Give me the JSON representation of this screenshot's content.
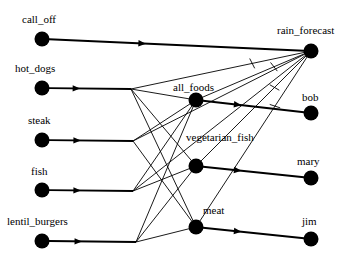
{
  "diagram": {
    "type": "causal-influence-graph",
    "background_color": "#ffffff",
    "node_color": "#000000",
    "edge_color": "#000000",
    "node_radius": 7.5,
    "nodes": [
      {
        "id": "call_off",
        "label": "call_off",
        "x": 42,
        "y": 39,
        "label_x": 22,
        "label_y": 14,
        "column": "left"
      },
      {
        "id": "hot_dogs",
        "label": "hot_dogs",
        "x": 42,
        "y": 88,
        "label_x": 15,
        "label_y": 63,
        "column": "left"
      },
      {
        "id": "steak",
        "label": "steak",
        "x": 42,
        "y": 140,
        "label_x": 28,
        "label_y": 115,
        "column": "left"
      },
      {
        "id": "fish",
        "label": "fish",
        "x": 42,
        "y": 190,
        "label_x": 31,
        "label_y": 166,
        "column": "left"
      },
      {
        "id": "lentil_burgers",
        "label": "lentil_burgers",
        "x": 42,
        "y": 241,
        "label_x": 7,
        "label_y": 216,
        "column": "left"
      },
      {
        "id": "all_foods",
        "label": "all_foods",
        "x": 196,
        "y": 100,
        "label_x": 173,
        "label_y": 82,
        "column": "middle"
      },
      {
        "id": "vegetarian_fish",
        "label": "vegetarian_fish",
        "x": 196,
        "y": 166,
        "label_x": 186,
        "label_y": 132,
        "column": "middle"
      },
      {
        "id": "meat",
        "label": "meat",
        "x": 196,
        "y": 227,
        "label_x": 203,
        "label_y": 205,
        "column": "middle"
      },
      {
        "id": "rain_forecast",
        "label": "rain_forecast",
        "x": 311,
        "y": 51,
        "label_x": 277,
        "label_y": 25,
        "column": "right"
      },
      {
        "id": "bob",
        "label": "bob",
        "x": 311,
        "y": 113,
        "label_x": 302,
        "label_y": 92,
        "column": "right"
      },
      {
        "id": "mary",
        "label": "mary",
        "x": 311,
        "y": 178,
        "label_x": 297,
        "label_y": 156,
        "column": "right"
      },
      {
        "id": "jim",
        "label": "jim",
        "x": 311,
        "y": 239,
        "label_x": 302,
        "label_y": 216,
        "column": "right"
      }
    ],
    "thick_edges": [
      {
        "from": "rain_forecast",
        "to": "call_off",
        "arrow_at": 0.62
      },
      {
        "from": "junction_hot",
        "to": "hot_dogs",
        "arrow_at": 0.62
      },
      {
        "from": "junction_steak",
        "to": "steak",
        "arrow_at": 0.62
      },
      {
        "from": "junction_fish",
        "to": "fish",
        "arrow_at": 0.62
      },
      {
        "from": "junction_lentil",
        "to": "lentil_burgers",
        "arrow_at": 0.62
      },
      {
        "from": "bob",
        "to": "all_foods",
        "arrow_at": 0.62
      },
      {
        "from": "mary",
        "to": "vegetarian_fish",
        "arrow_at": 0.62
      },
      {
        "from": "jim",
        "to": "meat",
        "arrow_at": 0.62
      }
    ],
    "fan_edges": [
      {
        "from": "all_foods",
        "to": "junction_hot"
      },
      {
        "from": "all_foods",
        "to": "junction_steak"
      },
      {
        "from": "all_foods",
        "to": "junction_fish"
      },
      {
        "from": "all_foods",
        "to": "junction_lentil"
      },
      {
        "from": "vegetarian_fish",
        "to": "junction_hot"
      },
      {
        "from": "vegetarian_fish",
        "to": "junction_fish"
      },
      {
        "from": "vegetarian_fish",
        "to": "junction_lentil"
      },
      {
        "from": "meat",
        "to": "junction_hot"
      },
      {
        "from": "meat",
        "to": "junction_steak"
      },
      {
        "from": "meat",
        "to": "junction_lentil"
      }
    ],
    "forecast_edges": [
      {
        "from": "rain_forecast",
        "to": "all_foods",
        "tick": true
      },
      {
        "from": "rain_forecast",
        "to": "vegetarian_fish",
        "tick": true
      },
      {
        "from": "rain_forecast",
        "to": "meat",
        "tick": true
      },
      {
        "from": "rain_forecast",
        "to": "junction_hot",
        "tick": true
      },
      {
        "from": "rain_forecast",
        "to": "junction_steak",
        "tick": false
      },
      {
        "from": "rain_forecast",
        "to": "junction_fish",
        "tick": false
      }
    ],
    "junctions": [
      {
        "id": "junction_hot",
        "x": 131,
        "y": 89
      },
      {
        "id": "junction_steak",
        "x": 133,
        "y": 141
      },
      {
        "id": "junction_fish",
        "x": 133,
        "y": 191
      },
      {
        "id": "junction_lentil",
        "x": 136,
        "y": 242
      }
    ]
  }
}
